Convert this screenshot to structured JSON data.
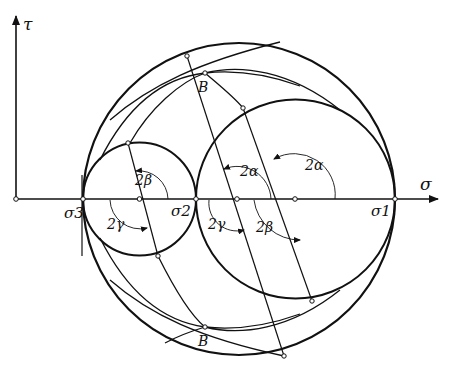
{
  "diagram": {
    "axes": {
      "horizontal_label": "σ",
      "vertical_label": "τ"
    },
    "principal_stresses": {
      "sigma3": "σ3",
      "sigma2": "σ2",
      "sigma1": "σ1"
    },
    "point_labels": {
      "upper_point": "B",
      "lower_point": "B"
    },
    "angle_labels": {
      "small_circle_upper": "2β",
      "small_circle_lower": "2γ",
      "medium_circle_upper_left": "2α",
      "medium_circle_upper_right": "2α",
      "medium_circle_lower_left": "2γ",
      "medium_circle_lower_right": "2β"
    },
    "colors": {
      "ink": "#111111",
      "background": "#ffffff"
    }
  }
}
